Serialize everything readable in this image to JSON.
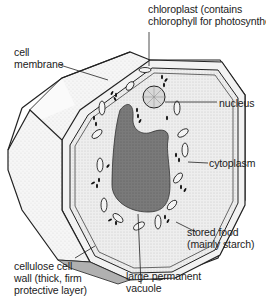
{
  "diagram": {
    "labels": {
      "chloroplast": [
        "chloroplast (contains",
        "chlorophyll for photosynthesis)"
      ],
      "cell_membrane": [
        "cell",
        "membrane"
      ],
      "nucleus": [
        "nucleus"
      ],
      "cytoplasm": [
        "cytoplasm"
      ],
      "stored_food": [
        "stored food",
        "(mainly starch)"
      ],
      "cell_wall": [
        "cellulose cell",
        "wall (thick, firm",
        "protective layer)"
      ],
      "vacuole": [
        "large permanent",
        "vacuole"
      ]
    },
    "colors": {
      "outline": "#222222",
      "wall_fill": "#f4f4f4",
      "cytoplasm_fill": "#ececec",
      "vacuole_fill": "#777777",
      "nucleus_fill": "#d8d8d8"
    }
  }
}
